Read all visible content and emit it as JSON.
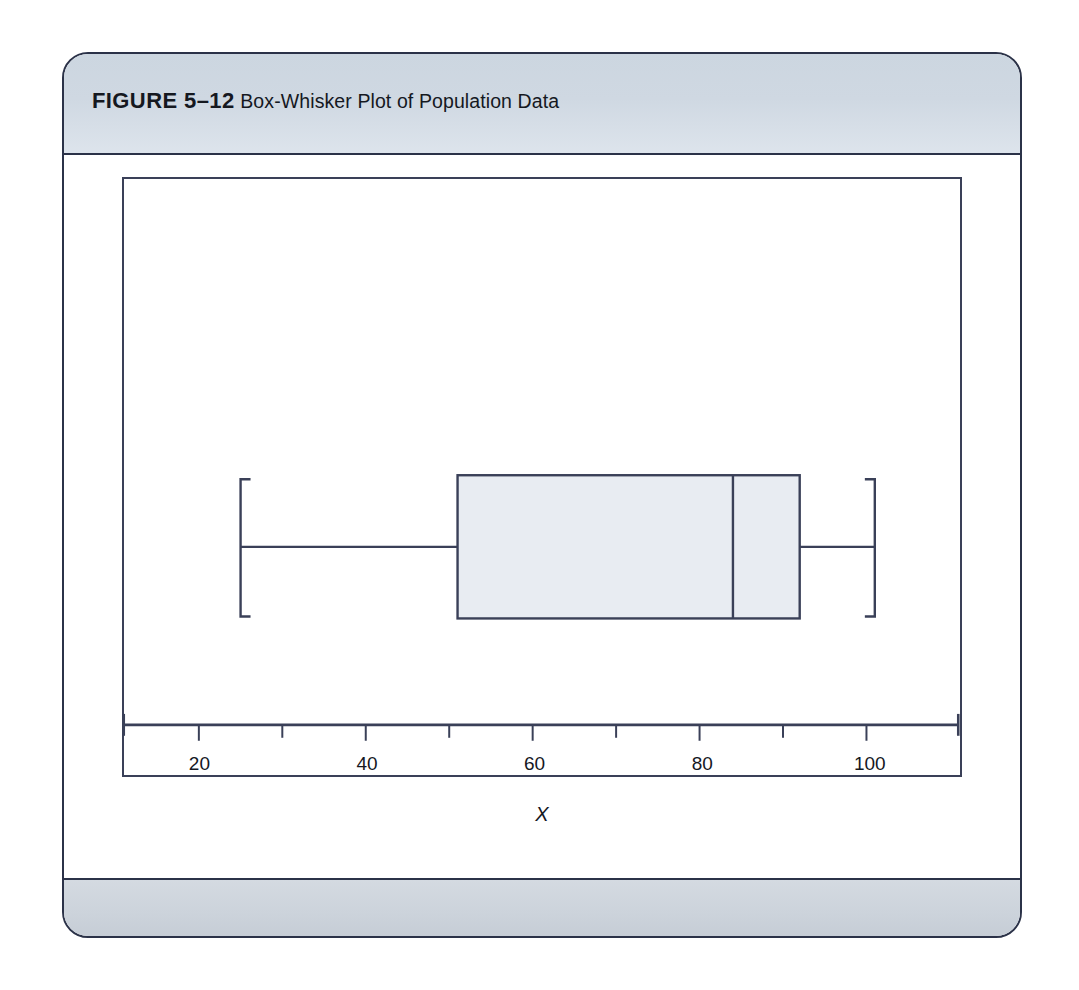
{
  "figure": {
    "label": "FIGURE 5–12",
    "caption": "Box-Whisker Plot of Population Data"
  },
  "colors": {
    "border": "#2b3248",
    "header_band": "#cfd8e2",
    "footer_band": "#ccd3db",
    "plot_line": "#3a4058",
    "box_fill": "#e8ecf2",
    "page_background": "#ffffff"
  },
  "chart_data": {
    "type": "box",
    "title": "Box-Whisker Plot of Population Data",
    "xlabel": "X",
    "ylabel": "",
    "orientation": "horizontal",
    "xlim": [
      11,
      111
    ],
    "grid": false,
    "legend": null,
    "tick_labels": [
      "20",
      "40",
      "60",
      "80",
      "100"
    ],
    "tick_values": [
      20,
      40,
      60,
      80,
      100
    ],
    "minor_tick_values": [
      30,
      50,
      70,
      90
    ],
    "series": [
      {
        "name": "Population Data",
        "min_whisker": 25,
        "q1": 51,
        "median": 84,
        "q3": 92,
        "max_whisker": 101,
        "outliers": []
      }
    ],
    "annotations": []
  },
  "axis": {
    "title": "X",
    "ticks": [
      {
        "label": "20",
        "value": 20
      },
      {
        "label": "40",
        "value": 40
      },
      {
        "label": "60",
        "value": 60
      },
      {
        "label": "80",
        "value": 80
      },
      {
        "label": "100",
        "value": 100
      }
    ]
  }
}
